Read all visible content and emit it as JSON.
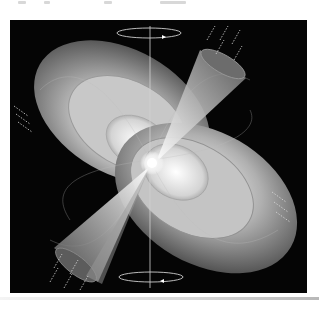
{
  "figure": {
    "elements": [
      "neutron-star",
      "magnetic-field-lobes",
      "radiation-beam-upper",
      "radiation-beam-lower",
      "rotation-axis",
      "rotation-arrow-top",
      "rotation-arrow-bottom",
      "emission-waves"
    ],
    "colors": {
      "background": "#050505",
      "lobe_light": "#e6e6e6",
      "lobe_mid": "#9a9a9a",
      "lobe_dark": "#4a4a4a",
      "beam": "#8c8c8c",
      "axis_line": "#cfcfcf",
      "page": "#ffffff"
    }
  }
}
